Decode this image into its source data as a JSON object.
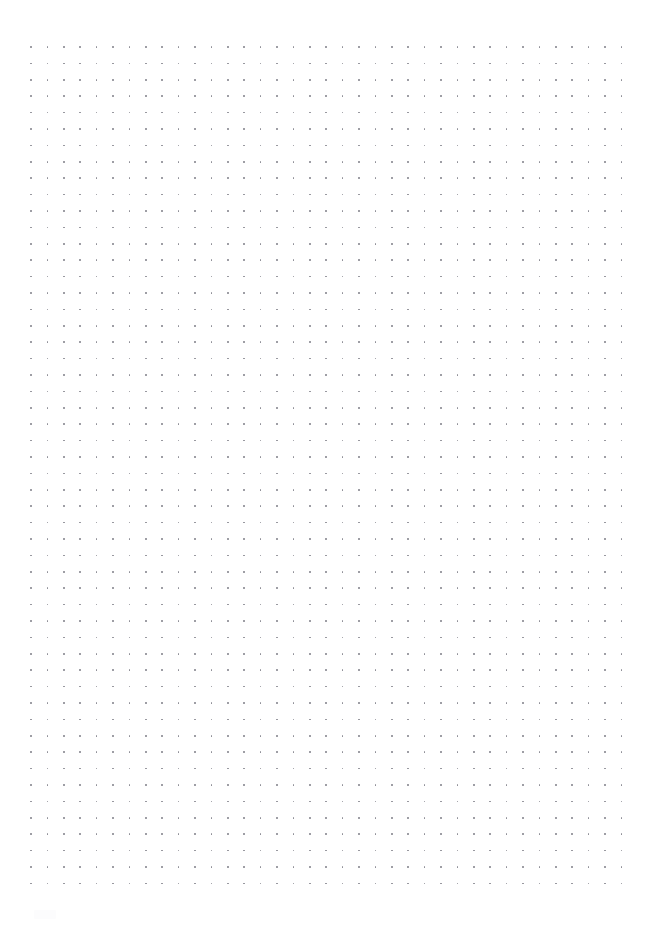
{
  "page": {
    "title": "Dot Grid Paper",
    "paper_type": "dot grid",
    "orientation": "portrait",
    "width_px": 653,
    "height_px": 931,
    "background_color": "#ffffff",
    "content_text": ""
  },
  "grid": {
    "name": "dot-grid",
    "dot_color": "#8b8b93",
    "dot_diameter_px": 1.6,
    "spacing_px": 16.4,
    "origin_x_px": 31,
    "origin_y_px": 47,
    "columns": 37,
    "rows": 52,
    "margin_left_px": 31,
    "margin_top_px": 47,
    "margin_right_px": 32,
    "margin_bottom_px": 45
  },
  "watermark": {
    "visible": true,
    "color": "#fcfcfd",
    "x_px": 34,
    "y_px": 910
  }
}
